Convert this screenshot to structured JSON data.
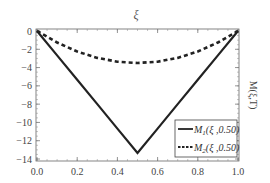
{
  "chart_data": {
    "type": "line",
    "title": "ξ",
    "xlabel": "",
    "ylabel": "M(ξ,T)",
    "xlim": [
      0.0,
      1.0
    ],
    "ylim": [
      -14,
      0
    ],
    "x_ticks": [
      "0.0",
      "0.2",
      "0.4",
      "0.6",
      "0.8",
      "1.0"
    ],
    "y_ticks": [
      "0",
      "-2",
      "-4",
      "-6",
      "-8",
      "-10",
      "-12",
      "-14"
    ],
    "grid": false,
    "legend_position": "lower right",
    "x": [
      0.0,
      0.1,
      0.2,
      0.3,
      0.4,
      0.5,
      0.6,
      0.7,
      0.8,
      0.9,
      1.0
    ],
    "series": [
      {
        "name": "M1(ξ,0.50)",
        "style": "solid",
        "values": [
          0.0,
          -2.67,
          -5.33,
          -8.0,
          -10.67,
          -13.33,
          -10.67,
          -8.0,
          -5.33,
          -2.67,
          0.0
        ]
      },
      {
        "name": "M2(ξ,0.50)",
        "style": "dashed",
        "values": [
          0.0,
          -1.26,
          -2.24,
          -2.94,
          -3.36,
          -3.5,
          -3.36,
          -2.94,
          -2.24,
          -1.26,
          0.0
        ]
      }
    ]
  },
  "legend": {
    "m1_label": "M",
    "m1_sub": "1",
    "m1_args": "(ξ ,0.50)",
    "m2_label": "M",
    "m2_sub": "2",
    "m2_args": "(ξ ,0.50)"
  }
}
